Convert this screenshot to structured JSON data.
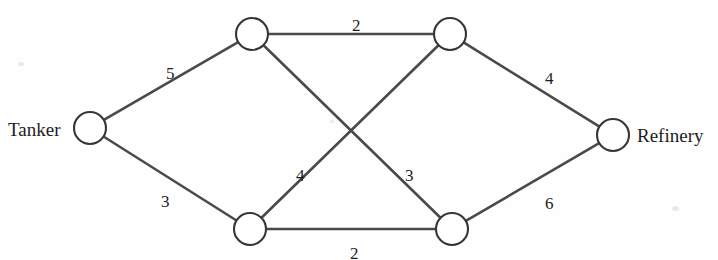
{
  "figure": {
    "name": "weighted-network-diagram",
    "background_color": "#fefefe",
    "line_color": "#4a4a4e",
    "node_fill": "#ffffff",
    "node_stroke": "#35353a",
    "text_color": "#1d1d20",
    "width": 718,
    "height": 260
  },
  "terminals": {
    "source_label": "Tanker",
    "sink_label": "Refinery"
  },
  "nodes": [
    {
      "id": "tanker",
      "label": "Tanker",
      "cx": 90,
      "cy": 128,
      "r": 16
    },
    {
      "id": "top-left",
      "label": "",
      "cx": 252,
      "cy": 34,
      "r": 16
    },
    {
      "id": "top-right",
      "label": "",
      "cx": 450,
      "cy": 34,
      "r": 16
    },
    {
      "id": "bottom-left",
      "label": "",
      "cx": 250,
      "cy": 229,
      "r": 16
    },
    {
      "id": "bottom-right",
      "label": "",
      "cx": 452,
      "cy": 229,
      "r": 16
    },
    {
      "id": "refinery",
      "label": "Refinery",
      "cx": 613,
      "cy": 135,
      "r": 16
    }
  ],
  "edges": [
    {
      "id": "tanker-top-left",
      "from": "tanker",
      "to": "top-left",
      "weight": "5",
      "label_x": 166,
      "label_y": 65
    },
    {
      "id": "tanker-bottom-left",
      "from": "tanker",
      "to": "bottom-left",
      "weight": "3",
      "label_x": 161,
      "label_y": 193
    },
    {
      "id": "top-left-top-right",
      "from": "top-left",
      "to": "top-right",
      "weight": "2",
      "label_x": 352,
      "label_y": 17
    },
    {
      "id": "top-left-bottom-right",
      "from": "top-left",
      "to": "bottom-right",
      "weight": "3",
      "label_x": 405,
      "label_y": 167
    },
    {
      "id": "bottom-left-top-right",
      "from": "bottom-left",
      "to": "top-right",
      "weight": "4",
      "label_x": 296,
      "label_y": 167
    },
    {
      "id": "bottom-left-bottom-right",
      "from": "bottom-left",
      "to": "bottom-right",
      "weight": "2",
      "label_x": 350,
      "label_y": 245
    },
    {
      "id": "top-right-refinery",
      "from": "top-right",
      "to": "refinery",
      "weight": "4",
      "label_x": 545,
      "label_y": 70
    },
    {
      "id": "bottom-right-refinery",
      "from": "bottom-right",
      "to": "refinery",
      "weight": "6",
      "label_x": 545,
      "label_y": 195
    }
  ],
  "labels": {
    "tanker": {
      "text": "Tanker",
      "x": 8,
      "y": 120
    },
    "refinery": {
      "text": "Refinery",
      "x": 637,
      "y": 126
    }
  },
  "chart_data": {
    "type": "diagram",
    "diagram_kind": "weighted-flow-network",
    "title": "",
    "nodes": [
      "Tanker",
      "A",
      "B",
      "C",
      "D",
      "Refinery"
    ],
    "edges": [
      {
        "source": "Tanker",
        "target": "A",
        "weight": 5
      },
      {
        "source": "Tanker",
        "target": "C",
        "weight": 3
      },
      {
        "source": "A",
        "target": "B",
        "weight": 2
      },
      {
        "source": "A",
        "target": "D",
        "weight": 3
      },
      {
        "source": "C",
        "target": "B",
        "weight": 4
      },
      {
        "source": "C",
        "target": "D",
        "weight": 2
      },
      {
        "source": "B",
        "target": "Refinery",
        "weight": 4
      },
      {
        "source": "D",
        "target": "Refinery",
        "weight": 6
      }
    ],
    "weights": [
      5,
      3,
      2,
      3,
      4,
      2,
      4,
      6
    ],
    "legend": [],
    "grid": false
  }
}
